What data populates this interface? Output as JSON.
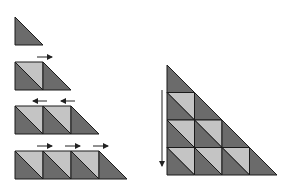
{
  "diagram": {
    "title": "",
    "colors": {
      "dark": "#6b6b6b",
      "light": "#c4c4c4",
      "stroke": "#1a1a1a",
      "arrow": "#222222",
      "background": "#ffffff"
    },
    "cell_size": 28,
    "left_sequence": [
      {
        "row": 1,
        "squares": 0,
        "arrows": [],
        "arrow_direction": "none"
      },
      {
        "row": 2,
        "squares": 1,
        "arrows": [
          1
        ],
        "arrow_direction": "right"
      },
      {
        "row": 3,
        "squares": 2,
        "arrows": [
          1,
          2
        ],
        "arrow_direction": "left"
      },
      {
        "row": 4,
        "squares": 3,
        "arrows": [
          1,
          2,
          3
        ],
        "arrow_direction": "right"
      }
    ],
    "right_figure": {
      "rows": 4,
      "arrow_direction": "down"
    }
  }
}
